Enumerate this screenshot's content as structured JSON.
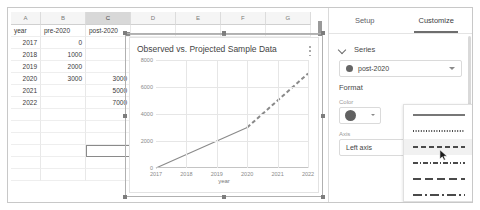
{
  "spreadsheet": {
    "column_headers": [
      "A",
      "B",
      "C",
      "D",
      "E",
      "F",
      "G"
    ],
    "selected_column": "C",
    "header_row": [
      "year",
      "pre-2020",
      "post-2020"
    ],
    "rows": [
      {
        "year": "2017",
        "pre": "0",
        "post": ""
      },
      {
        "year": "2018",
        "pre": "1000",
        "post": ""
      },
      {
        "year": "2019",
        "pre": "2000",
        "post": ""
      },
      {
        "year": "2020",
        "pre": "3000",
        "post": "3000"
      },
      {
        "year": "2021",
        "pre": "",
        "post": "5000"
      },
      {
        "year": "2022",
        "pre": "",
        "post": "7000"
      }
    ],
    "active_cell_value": ""
  },
  "chart": {
    "title": "Observed vs. Projected Sample Data",
    "menu_icon": "kebab-menu-icon"
  },
  "chart_data": {
    "type": "line",
    "title": "Observed vs. Projected Sample Data",
    "xlabel": "year",
    "ylabel": "",
    "x": [
      2017,
      2018,
      2019,
      2020,
      2021,
      2022
    ],
    "xticks": [
      "2017",
      "2018",
      "2019",
      "2020",
      "2021",
      "2022"
    ],
    "yticks": [
      "0",
      "2000",
      "4000",
      "6000",
      "8000"
    ],
    "xlim": [
      2017,
      2022
    ],
    "ylim": [
      0,
      8000
    ],
    "grid": true,
    "legend": "none",
    "series": [
      {
        "name": "pre-2020",
        "style": "solid",
        "color": "#8a8a8a",
        "x": [
          2017,
          2018,
          2019,
          2020
        ],
        "values": [
          0,
          1000,
          2000,
          3000
        ]
      },
      {
        "name": "post-2020",
        "style": "dashed",
        "color": "#8a8a8a",
        "x": [
          2020,
          2021,
          2022
        ],
        "values": [
          3000,
          5000,
          7000
        ]
      }
    ]
  },
  "sidebar": {
    "tabs": [
      {
        "label": "Setup",
        "active": false
      },
      {
        "label": "Customize",
        "active": true
      }
    ],
    "series_section": {
      "title": "Series",
      "chevron_icon": "chevron-down-icon",
      "selected_series": "post-2020",
      "series_color": "#666666"
    },
    "format_section": {
      "title": "Format",
      "color_label": "Color",
      "color_value": "#616161",
      "axis_label": "Axis",
      "axis_value": "Left axis"
    }
  },
  "line_style_menu": {
    "options": [
      {
        "name": "solid",
        "dash": "none"
      },
      {
        "name": "dotted",
        "dash": "1,1.6"
      },
      {
        "name": "dashed",
        "dash": "5,3"
      },
      {
        "name": "dash-dot",
        "dash": "5,2,1,2"
      },
      {
        "name": "long-dash",
        "dash": "8,4"
      },
      {
        "name": "long-dash-dot",
        "dash": "9,3,2,3"
      }
    ],
    "hovered_index": 2
  }
}
